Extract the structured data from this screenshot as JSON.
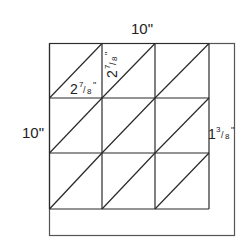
{
  "diagram": {
    "title_top": "10\"",
    "label_left": "10\"",
    "label_right": {
      "whole": "1",
      "num": "3",
      "den": "8",
      "unit": "\""
    },
    "label_triangle_bottom": {
      "whole": "2",
      "num": "7",
      "den": "8",
      "unit": "\""
    },
    "label_triangle_side": {
      "whole": "2",
      "num": "7",
      "den": "8",
      "unit": "\""
    },
    "grid": {
      "rows": 3,
      "cols": 3
    },
    "colors": {
      "line": "#2a2a2a",
      "outer": "#555555",
      "text": "#222222",
      "background": "#ffffff"
    }
  }
}
